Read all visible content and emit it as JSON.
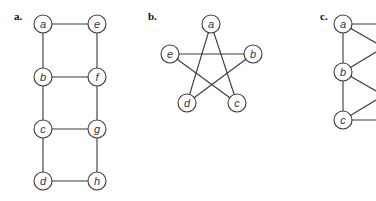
{
  "figure": {
    "panels": [
      {
        "label": "a.",
        "label_pos": [
          14,
          20
        ],
        "nodes": [
          {
            "id": "a",
            "x": 43,
            "y": 24
          },
          {
            "id": "e",
            "x": 97,
            "y": 24
          },
          {
            "id": "b",
            "x": 43,
            "y": 77
          },
          {
            "id": "f",
            "x": 97,
            "y": 77
          },
          {
            "id": "c",
            "x": 43,
            "y": 129
          },
          {
            "id": "g",
            "x": 97,
            "y": 129
          },
          {
            "id": "d",
            "x": 43,
            "y": 181
          },
          {
            "id": "h",
            "x": 97,
            "y": 181
          }
        ],
        "edges": [
          [
            "a",
            "e"
          ],
          [
            "a",
            "b"
          ],
          [
            "e",
            "f"
          ],
          [
            "b",
            "f"
          ],
          [
            "b",
            "c"
          ],
          [
            "f",
            "g"
          ],
          [
            "c",
            "g"
          ],
          [
            "c",
            "d"
          ],
          [
            "g",
            "h"
          ],
          [
            "d",
            "h"
          ]
        ]
      },
      {
        "label": "b.",
        "label_pos": [
          148,
          20
        ],
        "nodes": [
          {
            "id": "a",
            "x": 211,
            "y": 24
          },
          {
            "id": "e",
            "x": 170,
            "y": 54
          },
          {
            "id": "b",
            "x": 253,
            "y": 54
          },
          {
            "id": "d",
            "x": 187,
            "y": 103
          },
          {
            "id": "c",
            "x": 237,
            "y": 103
          }
        ],
        "edges": [
          [
            "a",
            "d"
          ],
          [
            "a",
            "c"
          ],
          [
            "e",
            "b"
          ],
          [
            "e",
            "c"
          ],
          [
            "b",
            "d"
          ]
        ]
      },
      {
        "label": "c.",
        "label_pos": [
          320,
          20
        ],
        "nodes": [
          {
            "id": "a",
            "x": 343,
            "y": 24
          },
          {
            "id": "b",
            "x": 343,
            "y": 72
          },
          {
            "id": "c",
            "x": 343,
            "y": 120
          }
        ],
        "edges": [
          [
            "a",
            "b"
          ],
          [
            "b",
            "c"
          ]
        ],
        "offscreen_edges": [
          {
            "from": "a",
            "to": [
              376,
              24
            ]
          },
          {
            "from": "a",
            "to": [
              376,
              43
            ]
          },
          {
            "from": "b",
            "to": [
              376,
              52
            ]
          },
          {
            "from": "b",
            "to": [
              376,
              91
            ]
          },
          {
            "from": "c",
            "to": [
              376,
              100
            ]
          },
          {
            "from": "c",
            "to": [
              376,
              120
            ]
          }
        ]
      }
    ],
    "node_radius": 9
  }
}
